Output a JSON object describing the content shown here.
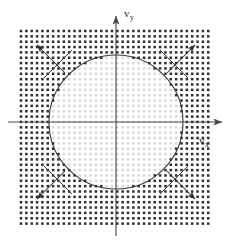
{
  "figure": {
    "background_color": "#ffffff"
  },
  "axes": {
    "x_axis": {
      "label_main": "v",
      "label_sub": "x",
      "name": "v_x",
      "color": "#4a4a4a",
      "origin_px": [
        116,
        122
      ],
      "end_px": [
        226,
        122
      ],
      "arrow": "right"
    },
    "y_axis": {
      "label_main": "v",
      "label_sub": "y",
      "name": "v_y",
      "color": "#4a4a4a",
      "origin_px": [
        116,
        122
      ],
      "end_px": [
        116,
        13
      ],
      "arrow": "up"
    }
  },
  "circle": {
    "name": "fermi-circle",
    "center_px": [
      116,
      122
    ],
    "radius_px": 67,
    "stroke_color": "#3a3a3a",
    "stroke_width": 1.1,
    "fill": "none"
  },
  "lattice": {
    "name": "dot-lattice",
    "x_start": 21,
    "y_start": 31,
    "spacing": 5.35,
    "cols": 36,
    "rows": 37,
    "dot_size": 2.5,
    "color_outside": "#2d2d2d",
    "color_inside": "#d8d8d8",
    "description": "Square dot lattice; dots outside the Fermi circle are dark, dots inside are light gray"
  },
  "arrow_pairs": [
    {
      "name": "arrow-pair-upper-left",
      "angle_deg": 135,
      "outward": {
        "from_px": [
          65,
          73
        ],
        "to_px": [
          37,
          45
        ],
        "arrow": true
      },
      "inward": {
        "from_px": [
          37,
          45
        ],
        "to_px": [
          72,
          80
        ],
        "arrow": false
      },
      "cross_from_px": [
        44,
        78
      ],
      "cross_to_px": [
        72,
        50
      ]
    },
    {
      "name": "arrow-pair-upper-right",
      "angle_deg": 45,
      "outward": {
        "from_px": [
          167,
          73
        ],
        "to_px": [
          195,
          45
        ],
        "arrow": true
      },
      "inward": {
        "from_px": [
          195,
          45
        ],
        "to_px": [
          160,
          80
        ],
        "arrow": false
      },
      "cross_from_px": [
        188,
        78
      ],
      "cross_to_px": [
        160,
        50
      ]
    },
    {
      "name": "arrow-pair-lower-left",
      "angle_deg": 225,
      "outward": {
        "from_px": [
          65,
          171
        ],
        "to_px": [
          37,
          199
        ],
        "arrow": true
      },
      "inward": {
        "from_px": [
          37,
          199
        ],
        "to_px": [
          72,
          164
        ],
        "arrow": false
      },
      "cross_from_px": [
        44,
        166
      ],
      "cross_to_px": [
        72,
        194
      ]
    },
    {
      "name": "arrow-pair-lower-right",
      "angle_deg": 315,
      "outward": {
        "from_px": [
          167,
          171
        ],
        "to_px": [
          195,
          199
        ],
        "arrow": true
      },
      "inward": {
        "from_px": [
          195,
          199
        ],
        "to_px": [
          160,
          164
        ],
        "arrow": false
      },
      "cross_from_px": [
        188,
        166
      ],
      "cross_to_px": [
        160,
        194
      ]
    }
  ],
  "colors": {
    "ink": "#2d2d2d",
    "axis": "#4a4a4a",
    "dot_dark": "#2d2d2d",
    "dot_light": "#d9d9d9",
    "paper": "#ffffff"
  }
}
